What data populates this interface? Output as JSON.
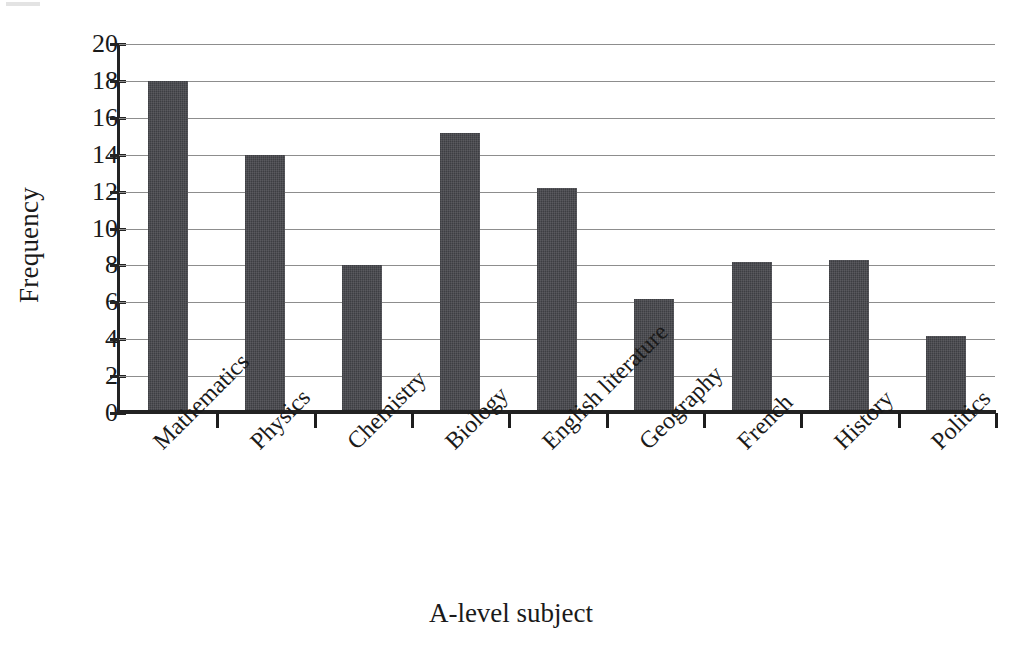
{
  "chart_data": {
    "type": "bar",
    "title": "",
    "xlabel": "A-level subject",
    "ylabel": "Frequency",
    "categories": [
      "Mathematics",
      "Physics",
      "Chemistry",
      "Biology",
      "English literature",
      "Geography",
      "French",
      "History",
      "Politics"
    ],
    "values": [
      18,
      14,
      8,
      15.2,
      12.2,
      6.2,
      8.2,
      8.3,
      4.2
    ],
    "ylim": [
      0,
      20
    ],
    "y_ticks": [
      0,
      2,
      4,
      6,
      8,
      10,
      12,
      14,
      16,
      18,
      20
    ],
    "y_tick_labels": [
      "0",
      "2",
      "4",
      "6",
      "8",
      "10",
      "12",
      "14",
      "16",
      "18",
      "20"
    ],
    "grid": true,
    "legend": "none",
    "bar_color": "#44454a",
    "gridline_color": "#8d8d8d",
    "axis_color": "#222222"
  },
  "axes": {
    "y_title": "Frequency",
    "x_title": "A-level subject"
  }
}
